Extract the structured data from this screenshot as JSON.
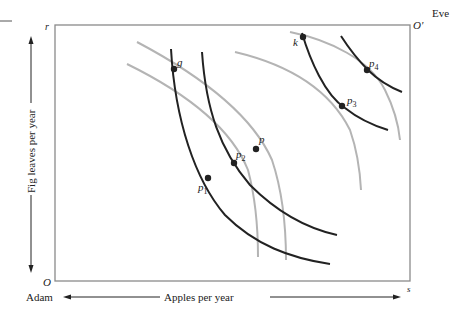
{
  "labels": {
    "eve": "Eve",
    "adam": "Adam",
    "origin_adam": "O",
    "origin_eve": "O'",
    "corner_r": "r",
    "corner_s": "s",
    "x_axis": "Apples per year",
    "y_axis": "Fig leaves per year"
  },
  "points": {
    "g": "g",
    "k": "k",
    "p": "p",
    "p1": "p",
    "p1_sub": "1",
    "p2": "p",
    "p2_sub": "2",
    "p3": "p",
    "p3_sub": "3",
    "p4": "p",
    "p4_sub": "4"
  },
  "colors": {
    "box": "#8a8a8a",
    "adam_curves": "#222222",
    "eve_curves": "#b4b4b4",
    "text": "#222222"
  }
}
